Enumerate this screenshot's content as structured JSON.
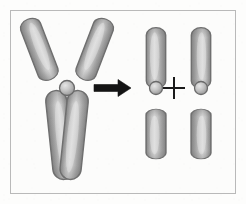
{
  "figure": {
    "background_color": "#fcfcfb",
    "frame_color": "#b9b9b9",
    "frame": {
      "x": 10,
      "y": 10,
      "width": 226,
      "height": 184
    }
  },
  "palette": {
    "chromatid_outline": "#6f6f6f",
    "chromatid_fill_dark": "#8e8e8e",
    "chromatid_fill_mid": "#a6a6a6",
    "chromatid_fill_light": "#d2d2d2",
    "chromatid_highlight": "#e2e2e2",
    "centromere_outline": "#6a6a6a",
    "centromere_fill": "#bfbfbf",
    "arrow_color": "#141414",
    "plus_color": "#1a1a1a"
  },
  "elements": {
    "left_chromosome": {
      "name": "duplicated-chromosome",
      "shape": "X",
      "arm_count": 4,
      "chromatid_count": 2,
      "centromere": {
        "cx": 67,
        "cy": 88,
        "r": 7.5,
        "shape": "circle"
      },
      "arms": [
        {
          "label": "upper-left-arm",
          "angle_deg": -21,
          "length": 64
        },
        {
          "label": "upper-right-arm",
          "angle_deg": 21,
          "length": 64
        },
        {
          "label": "lower-left-arm",
          "angle_deg": -6,
          "length": 90
        },
        {
          "label": "lower-right-arm",
          "angle_deg": 6,
          "length": 90
        }
      ]
    },
    "arrow": {
      "name": "transition-arrow",
      "direction": "right",
      "x_start": 94,
      "x_end": 131,
      "y_center": 88,
      "shaft_height": 7,
      "head_width": 13,
      "head_height": 17
    },
    "plus_sign": {
      "name": "plus-symbol",
      "symbol": "+",
      "cx": 174,
      "cy": 88,
      "arm_length": 11,
      "stroke_width": 2
    },
    "right_chromatids": [
      {
        "name": "separated-chromatid-1",
        "cx": 156,
        "top": 25,
        "bottom": 180,
        "centromere": {
          "cx": 156,
          "cy": 88,
          "r": 6.5,
          "shape": "circle"
        },
        "upper_arm_length": 58,
        "lower_arm_length": 86
      },
      {
        "name": "separated-chromatid-2",
        "cx": 201,
        "top": 25,
        "bottom": 180,
        "centromere": {
          "cx": 201,
          "cy": 88,
          "r": 6.5,
          "shape": "circle"
        },
        "upper_arm_length": 58,
        "lower_arm_length": 86
      }
    ]
  },
  "labels": {
    "text_present": false,
    "caption": "",
    "annotations": []
  }
}
